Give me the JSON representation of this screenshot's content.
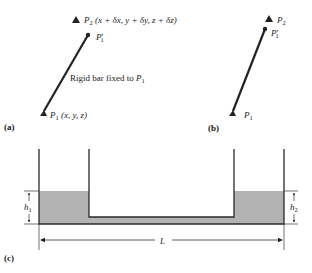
{
  "panel_a": {
    "label": "(a)",
    "p2_label": "P",
    "p2_sub": "2",
    "p2_coords": "(x + δx, y + δy, z + δz)",
    "p1prime_label": "P",
    "p1prime_sub": "1",
    "p1prime_mark": "′",
    "bar_text": "Rigid bar fixed to ",
    "bar_text_p": "P",
    "bar_text_sub": "1",
    "p1_label": "P",
    "p1_sub": "1",
    "p1_coords": "(x, y, z)"
  },
  "panel_b": {
    "label": "(b)",
    "p2_label": "P",
    "p2_sub": "2",
    "p1prime_label": "P",
    "p1prime_sub": "1",
    "p1prime_mark": "′",
    "p1_label": "P",
    "p1_sub": "1"
  },
  "panel_c": {
    "label": "(c)",
    "h1_label": "h",
    "h1_sub": "1",
    "h2_label": "h",
    "h2_sub": "2",
    "length_label": "L",
    "fluid_color": "#b3b3b3",
    "line_color": "#2a2a2a"
  }
}
